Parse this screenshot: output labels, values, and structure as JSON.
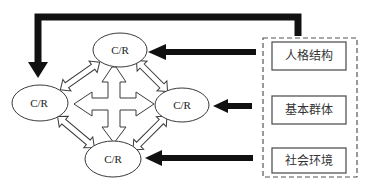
{
  "diagram": {
    "type": "flow-diagram",
    "nodes": [
      {
        "id": "top",
        "label": "C/R",
        "cx": 120,
        "cy": 50
      },
      {
        "id": "left",
        "label": "C/R",
        "cx": 40,
        "cy": 103
      },
      {
        "id": "right",
        "label": "C/R",
        "cx": 182,
        "cy": 105
      },
      {
        "id": "bottom",
        "label": "C/R",
        "cx": 114,
        "cy": 159
      }
    ],
    "factor_group": {
      "style": "dashed",
      "factors": [
        {
          "id": "personality",
          "label": "人格结构"
        },
        {
          "id": "basic-group",
          "label": "基本群体"
        },
        {
          "id": "social-env",
          "label": "社会环境"
        }
      ]
    },
    "edges": [
      {
        "from": "personality",
        "to": "top",
        "style": "solid-bold"
      },
      {
        "from": "basic-group",
        "to": "right",
        "style": "solid-bold"
      },
      {
        "from": "social-env",
        "to": "bottom",
        "style": "solid-bold"
      },
      {
        "from": "factor_group",
        "to": "left",
        "style": "solid-bold-feedback"
      },
      {
        "from": "top",
        "to": "left",
        "style": "hollow-double"
      },
      {
        "from": "top",
        "to": "right",
        "style": "hollow-double"
      },
      {
        "from": "bottom",
        "to": "left",
        "style": "hollow-double"
      },
      {
        "from": "bottom",
        "to": "right",
        "style": "hollow-double"
      },
      {
        "from": "center",
        "to": [
          "top",
          "left",
          "right",
          "bottom"
        ],
        "style": "hollow-four-way"
      }
    ],
    "colors": {
      "stroke": "#3a3a3a",
      "arrow_fill": "#111111",
      "background": "#ffffff"
    }
  }
}
